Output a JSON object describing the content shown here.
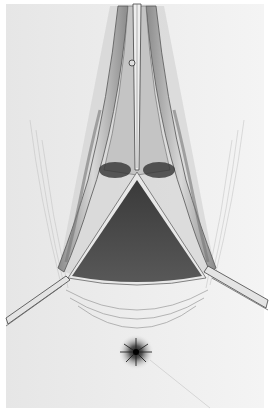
{
  "illustration": {
    "kind": "grayscale surgical pencil illustration",
    "alt": "Surgical exposure illustration with retractors holding open a triangular incision above a puckered orifice",
    "colors": {
      "paper": "#f1f1f1",
      "border": "#ffffff",
      "cavity": "#4a4a4a",
      "tissue_shade": "#9a9a9a",
      "line": "#555555",
      "instrument": "#dcdcdc"
    },
    "elements": [
      {
        "name": "upper-forceps",
        "description": "Long instrument clamping tissue, running vertically from top edge"
      },
      {
        "name": "left-tissue-fold",
        "description": "Retracted tissue fold on left side of incision"
      },
      {
        "name": "right-tissue-fold",
        "description": "Retracted tissue fold on right side of incision"
      },
      {
        "name": "triangular-cavity",
        "description": "Dark triangular opened cavity"
      },
      {
        "name": "left-retractor",
        "description": "Retractor entering from left edge"
      },
      {
        "name": "right-retractor",
        "description": "Retractor entering from right edge"
      },
      {
        "name": "orifice",
        "description": "Dark puckered star-shaped orifice below incision"
      }
    ]
  }
}
